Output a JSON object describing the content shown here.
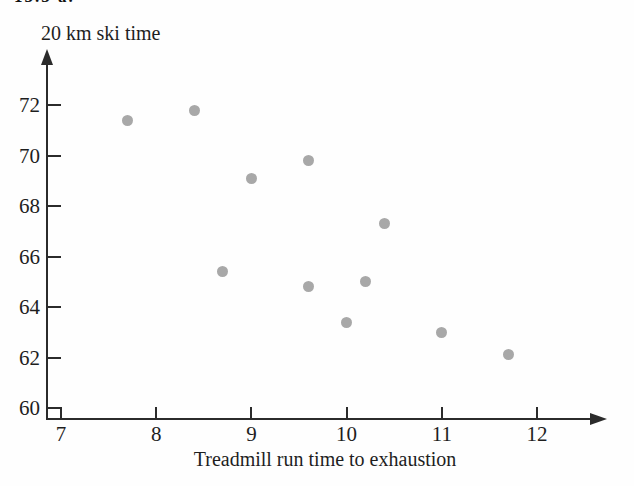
{
  "figure": {
    "label": "13.3 a."
  },
  "chart_data": {
    "type": "scatter",
    "title": "",
    "ylabel": "20 km ski time",
    "xlabel": "Treadmill run time to exhaustion",
    "x_ticks": [
      7,
      8,
      9,
      10,
      11,
      12
    ],
    "y_ticks": [
      60,
      62,
      64,
      66,
      68,
      70,
      72
    ],
    "xlim": [
      7,
      12.7
    ],
    "ylim": [
      59.5,
      74
    ],
    "grid": false,
    "legend": "none",
    "point_color": "#a8a8a8",
    "axis_color": "#2b2b2b",
    "points": [
      {
        "x": 7.7,
        "y": 71.4
      },
      {
        "x": 8.4,
        "y": 71.8
      },
      {
        "x": 8.7,
        "y": 65.4
      },
      {
        "x": 9.0,
        "y": 69.1
      },
      {
        "x": 9.6,
        "y": 69.8
      },
      {
        "x": 9.6,
        "y": 64.8
      },
      {
        "x": 10.0,
        "y": 63.4
      },
      {
        "x": 10.2,
        "y": 65.0
      },
      {
        "x": 10.4,
        "y": 67.3
      },
      {
        "x": 11.0,
        "y": 63.0
      },
      {
        "x": 11.7,
        "y": 62.1
      }
    ]
  }
}
